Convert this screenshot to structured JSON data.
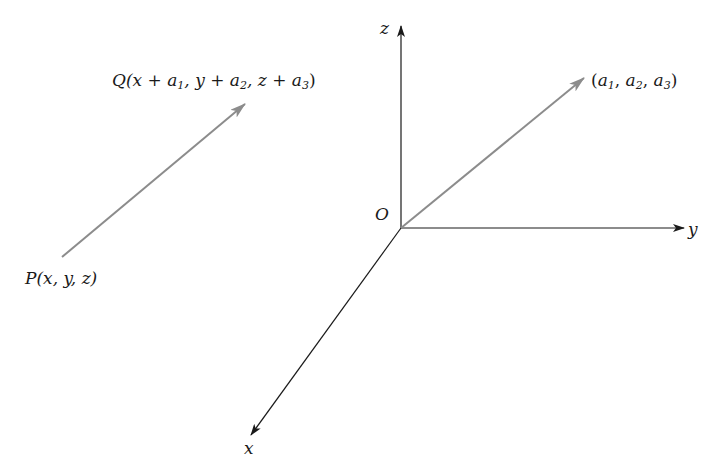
{
  "diagram": {
    "origin_label": "O",
    "axes": {
      "x": {
        "label": "x"
      },
      "y": {
        "label": "y"
      },
      "z": {
        "label": "z"
      }
    },
    "position_vector": {
      "tip_label": {
        "open": "(",
        "a1": "a",
        "s1": "1",
        "c1": ", ",
        "a2": "a",
        "s2": "2",
        "c2": ", ",
        "a3": "a",
        "s3": "3",
        "close": ")"
      }
    },
    "translated_vector": {
      "start_label": {
        "name": "P",
        "args": "(x, y, z)"
      },
      "end_label": {
        "name": "Q",
        "p1": "(x + ",
        "a1": "a",
        "s1": "1",
        "p2": ", y + ",
        "a2": "a",
        "s2": "2",
        "p3": ", z + ",
        "a3": "a",
        "s3": "3",
        "close": ")"
      }
    },
    "colors": {
      "axis": "#1a1a1a",
      "vector": "#8c8c8c"
    }
  }
}
